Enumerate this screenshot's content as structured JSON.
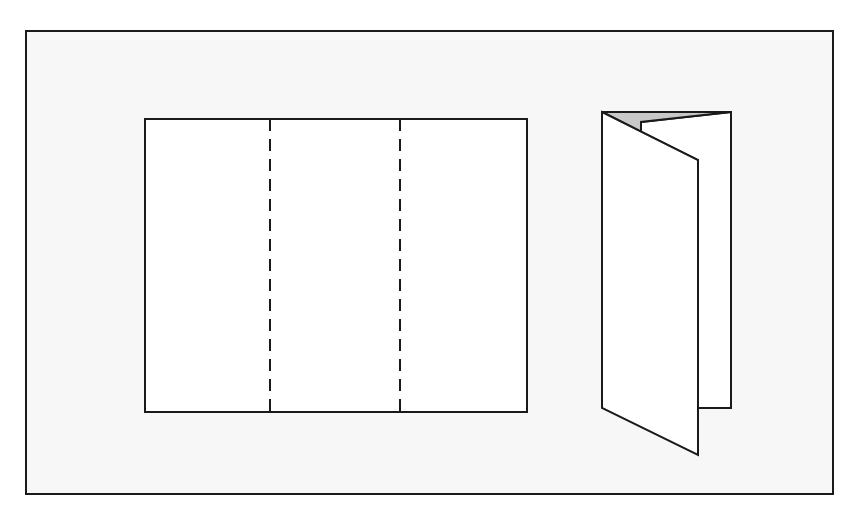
{
  "figure": {
    "colors": {
      "background": "#ffffff",
      "frame_fill": "#f7f7f7",
      "stroke": "#1a1a1a",
      "paper": "#ffffff",
      "shadow_fill": "#c8c8c8"
    },
    "flat_sheet": {
      "label": "",
      "panels": 3,
      "fold_lines": 2,
      "fold_line_style": "dashed"
    },
    "folded_brochure": {
      "label": "",
      "state": "tri-folded, standing"
    }
  }
}
